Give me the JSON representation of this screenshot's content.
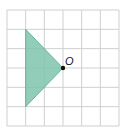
{
  "diagram": {
    "grid": {
      "cols": 6,
      "rows": 6,
      "line_color": "#cfcfcf"
    },
    "shape": {
      "type": "triangle",
      "vertices_grid": [
        [
          1,
          1
        ],
        [
          1,
          5
        ],
        [
          3,
          3
        ]
      ],
      "fill": "#7fc4ad",
      "stroke": "#5aa88e"
    },
    "point": {
      "label": "O",
      "grid": [
        3,
        3
      ],
      "color": "#111111"
    }
  }
}
